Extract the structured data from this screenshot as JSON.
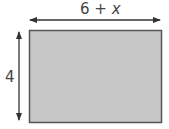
{
  "diagram": {
    "type": "rectangle-dimensions",
    "width_label": {
      "prefix": "6 + ",
      "variable": "x"
    },
    "height_label": "4",
    "colors": {
      "fill": "#c6c6c6",
      "stroke": "#555555",
      "arrow": "#333333",
      "text": "#444444"
    }
  }
}
